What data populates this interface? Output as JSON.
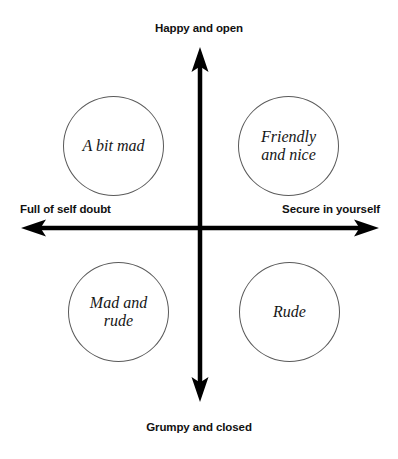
{
  "diagram": {
    "type": "two-axis-quadrant-matrix",
    "axes": {
      "vertical": {
        "top_label": "Happy and open",
        "bottom_label": "Grumpy and closed"
      },
      "horizontal": {
        "left_label": "Full of self doubt",
        "right_label": "Secure in yourself"
      },
      "color": "#000000"
    },
    "quadrants": [
      {
        "position": "top-left",
        "label": "A bit mad",
        "meaning": "Happy and open + Full of self doubt"
      },
      {
        "position": "top-right",
        "label": "Friendly\nand nice",
        "meaning": "Happy and open + Secure in yourself"
      },
      {
        "position": "bottom-left",
        "label": "Mad and\nrude",
        "meaning": "Grumpy and closed + Full of self doubt"
      },
      {
        "position": "bottom-right",
        "label": "Rude",
        "meaning": "Grumpy and closed + Secure in yourself"
      }
    ],
    "colors": {
      "background": "#ffffff",
      "axis": "#000000",
      "circle_stroke": "#5a5a5a",
      "label_text": "#111111",
      "bubble_text": "#161616"
    }
  }
}
